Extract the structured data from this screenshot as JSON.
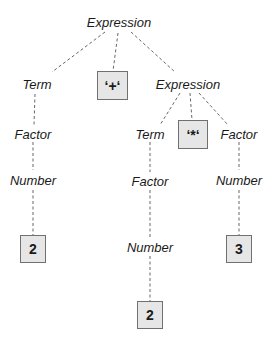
{
  "diagram": {
    "type": "parse-tree",
    "colors": {
      "edge": "#555555",
      "leaf_fill": "#e6e6e6",
      "leaf_border": "#707070",
      "text": "#1a1a1a"
    },
    "nodes": {
      "root": "Expression",
      "term_left": "Term",
      "plus": "‘+‘",
      "expr_right": "Expression",
      "factor_left": "Factor",
      "number_left": "Number",
      "leaf_left": "2",
      "term_mid": "Term",
      "star": "‘*‘",
      "factor_right": "Factor",
      "factor_mid": "Factor",
      "number_right": "Number",
      "number_mid": "Number",
      "leaf_right": "3",
      "leaf_mid": "2"
    },
    "edges": [
      [
        "root",
        "term_left"
      ],
      [
        "root",
        "plus"
      ],
      [
        "root",
        "expr_right"
      ],
      [
        "term_left",
        "factor_left"
      ],
      [
        "factor_left",
        "number_left"
      ],
      [
        "number_left",
        "leaf_left"
      ],
      [
        "expr_right",
        "term_mid"
      ],
      [
        "expr_right",
        "star"
      ],
      [
        "expr_right",
        "factor_right"
      ],
      [
        "term_mid",
        "factor_mid"
      ],
      [
        "factor_mid",
        "number_mid"
      ],
      [
        "number_mid",
        "leaf_mid"
      ],
      [
        "factor_right",
        "number_right"
      ],
      [
        "number_right",
        "leaf_right"
      ]
    ]
  }
}
